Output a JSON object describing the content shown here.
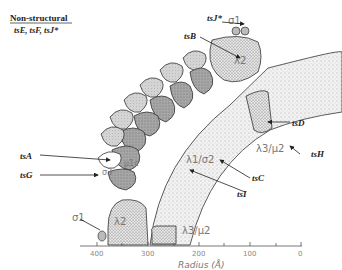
{
  "legend": {
    "heading": "Non-structural",
    "items": "tsE, tsF, tsJ*"
  },
  "pointer_labels": {
    "tsJ": "tsJ*",
    "tsB": "tsB",
    "tsD": "tsD",
    "tsH": "tsH",
    "tsC": "tsC",
    "tsI": "tsI",
    "tsA": "tsA",
    "tsG": "tsG"
  },
  "domain_labels": {
    "sigma1_top": "σ1",
    "lambda2_top": "λ2",
    "lambda3_mu2_right": "λ3/μ2",
    "lambda1_sigma2": "λ1/σ2",
    "mu1c": "μ1c",
    "sigma3": "σ3",
    "sigma1_bottom": "σ1",
    "lambda2_bottom": "λ2",
    "lambda3_mu2_bottom": "λ3/μ2"
  },
  "axis": {
    "label": "Radius (Å)",
    "ticks": [
      "400",
      "300",
      "200",
      "100",
      "0"
    ]
  },
  "colors": {
    "ink": "#333333",
    "light_fill": "#d9d9d9",
    "dark_fill": "#a8a8a8",
    "stipple_fill": "#ececec",
    "label_gray": "#777777"
  }
}
